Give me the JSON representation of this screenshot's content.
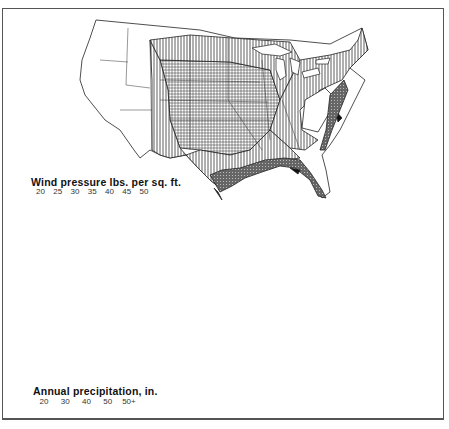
{
  "figure": {
    "maps": [
      {
        "id": "wind",
        "title": "Wind pressure lbs. per sq. ft.",
        "legend": {
          "ticks": [
            "20",
            "25",
            "30",
            "35",
            "40",
            "45",
            "50"
          ],
          "classes": [
            {
              "range": "20",
              "pattern": "blank"
            },
            {
              "range": "25",
              "pattern": "vertical-lines"
            },
            {
              "range": "30",
              "pattern": "fine-grid"
            },
            {
              "range": "35",
              "pattern": "dark-stipple"
            },
            {
              "range": "40",
              "pattern": "light-gray"
            },
            {
              "range": "45-50",
              "pattern": "solid-black"
            }
          ]
        }
      },
      {
        "id": "precip",
        "title": "Annual precipitation, in.",
        "legend": {
          "ticks": [
            "20",
            "30",
            "40",
            "50",
            "50+"
          ],
          "classes": [
            {
              "range": "20",
              "pattern": "blank"
            },
            {
              "range": "30",
              "pattern": "light-dots"
            },
            {
              "range": "40",
              "pattern": "horizontal-lines"
            },
            {
              "range": "50",
              "pattern": "crosshatch-dots"
            },
            {
              "range": "50+",
              "pattern": "heavy-checker"
            }
          ]
        }
      }
    ]
  }
}
